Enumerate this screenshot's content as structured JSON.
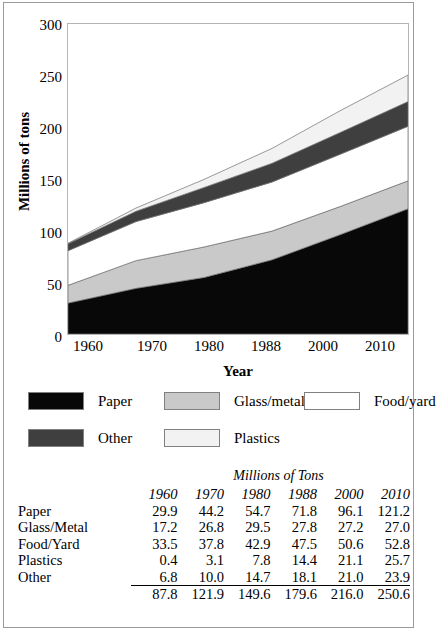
{
  "chart_data": {
    "type": "area",
    "title": "",
    "xlabel": "Year",
    "ylabel": "Millions of tons",
    "categories": [
      "1960",
      "1970",
      "1980",
      "1988",
      "2000",
      "2010"
    ],
    "x_numeric": [
      1960,
      1970,
      1980,
      1988,
      2000,
      2010
    ],
    "ylim": [
      0,
      300
    ],
    "yticks": [
      0,
      50,
      100,
      150,
      200,
      250,
      300
    ],
    "grid": false,
    "legend_position": "below-plot",
    "stacked": true,
    "stack_order_bottom_to_top": [
      "Paper",
      "Glass/metal",
      "Food/yard",
      "Other",
      "Plastics"
    ],
    "series": [
      {
        "name": "Paper",
        "values": [
          29.9,
          44.2,
          54.7,
          71.8,
          96.1,
          121.2
        ],
        "color": "#080808"
      },
      {
        "name": "Glass/metal",
        "values": [
          17.2,
          26.8,
          29.5,
          27.8,
          27.2,
          27.0
        ],
        "color": "#c9c9c9"
      },
      {
        "name": "Food/yard",
        "values": [
          33.5,
          37.8,
          42.9,
          47.5,
          50.6,
          52.8
        ],
        "color": "#ffffff"
      },
      {
        "name": "Other",
        "values": [
          6.8,
          10.0,
          14.7,
          18.1,
          21.0,
          23.9
        ],
        "color": "#3f3f3f"
      },
      {
        "name": "Plastics",
        "values": [
          0.4,
          3.1,
          7.8,
          14.4,
          21.1,
          25.7
        ],
        "color": "#f2f2f2"
      }
    ],
    "totals": [
      87.8,
      121.9,
      149.6,
      179.6,
      216.0,
      250.6
    ]
  },
  "axes": {
    "ylabel": "Millions of tons",
    "xlabel": "Year",
    "yticks": [
      "300",
      "250",
      "200",
      "150",
      "100",
      "50",
      "0"
    ],
    "xticks": [
      "1960",
      "1970",
      "1980",
      "1988",
      "2000",
      "2010"
    ]
  },
  "legend": {
    "items": [
      {
        "label": "Paper",
        "color": "#080808",
        "swatch": "swatch-paper"
      },
      {
        "label": "Glass/metal",
        "color": "#c9c9c9",
        "swatch": "swatch-glass-metal"
      },
      {
        "label": "Food/yard",
        "color": "#ffffff",
        "swatch": "swatch-food-yard"
      },
      {
        "label": "Other",
        "color": "#3f3f3f",
        "swatch": "swatch-other"
      },
      {
        "label": "Plastics",
        "color": "#f2f2f2",
        "swatch": "swatch-plastics"
      }
    ]
  },
  "table": {
    "caption": "Millions of Tons",
    "column_headers": [
      "1960",
      "1970",
      "1980",
      "1988",
      "2000",
      "2010"
    ],
    "rows": [
      {
        "label": "Paper",
        "values": [
          "29.9",
          "44.2",
          "54.7",
          "71.8",
          "96.1",
          "121.2"
        ]
      },
      {
        "label": "Glass/Metal",
        "values": [
          "17.2",
          "26.8",
          "29.5",
          "27.8",
          "27.2",
          "27.0"
        ]
      },
      {
        "label": "Food/Yard",
        "values": [
          "33.5",
          "37.8",
          "42.9",
          "47.5",
          "50.6",
          "52.8"
        ]
      },
      {
        "label": "Plastics",
        "values": [
          "0.4",
          "3.1",
          "7.8",
          "14.4",
          "21.1",
          "25.7"
        ]
      },
      {
        "label": "Other",
        "values": [
          "6.8",
          "10.0",
          "14.7",
          "18.1",
          "21.0",
          "23.9"
        ]
      }
    ],
    "total_row": {
      "label": "",
      "values": [
        "87.8",
        "121.9",
        "149.6",
        "179.6",
        "216.0",
        "250.6"
      ]
    }
  }
}
